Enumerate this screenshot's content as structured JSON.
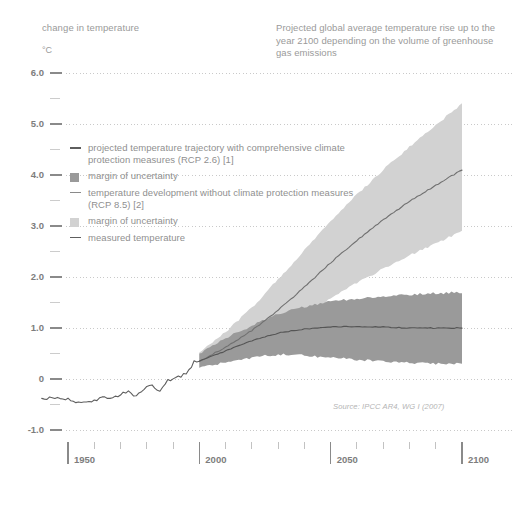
{
  "header": {
    "left_label": "change in temperature",
    "unit": "°C",
    "title": "Projected global average temperature rise up to the year 2100 depending on the volume of greenhouse gas emissions"
  },
  "source_note": "Source: IPCC AR4, WG I (2007)",
  "colors": {
    "background": "#ffffff",
    "text": "#8f8f8f",
    "axis": "#8a8a8a",
    "gridline": "#c9c9c9",
    "rcp26_band": "#9a9a9a",
    "rcp26_line": "#555555",
    "rcp85_band": "#d2d2d2",
    "rcp85_line": "#707070",
    "measured_line": "#5e5e5e"
  },
  "legend": {
    "items": [
      {
        "mark": "line",
        "color": "#5e5e5e",
        "label": "projected temperature trajectory with comprehensive climate protection measures (RCP 2.6) [1]"
      },
      {
        "mark": "swatch",
        "color": "#9a9a9a",
        "label": "margin of uncertainty"
      },
      {
        "mark": "line",
        "color": "#8a8a8a",
        "label": "temperature development without climate protection measures (RCP 8.5) [2]"
      },
      {
        "mark": "swatch",
        "color": "#d2d2d2",
        "label": "margin of uncertainty"
      },
      {
        "mark": "line",
        "color": "#5e5e5e",
        "label": "measured temperature"
      }
    ]
  },
  "chart_data": {
    "type": "line",
    "title": "Projected global average temperature rise up to the year 2100 depending on the volume of greenhouse gas emissions",
    "xlabel": "",
    "ylabel": "change in temperature",
    "yunit": "°C",
    "xlim": [
      1940,
      2100
    ],
    "ylim": [
      -1.0,
      6.0
    ],
    "xticks_major": [
      1950,
      2000,
      2050,
      2100
    ],
    "xticks_minor": [
      1960,
      1970,
      1980,
      1990,
      2010,
      2020,
      2030,
      2040,
      2060,
      2070,
      2080,
      2090
    ],
    "yticks_major": [
      -1.0,
      0,
      1.0,
      2.0,
      3.0,
      4.0,
      5.0,
      6.0
    ],
    "yticks_major_labels": [
      "-1.0",
      "0",
      "1.0",
      "2.0",
      "3.0",
      "4.0",
      "5.0",
      "6.0"
    ],
    "yticks_minor": [
      -0.5,
      0.5,
      1.5,
      2.5,
      3.5,
      4.5,
      5.5
    ],
    "grid": "horizontal-dotted",
    "legend_position": "inside-upper-left",
    "projection_start_year": 2000,
    "series": [
      {
        "name": "measured temperature",
        "type": "line",
        "x": [
          1940,
          1945,
          1950,
          1955,
          1960,
          1963,
          1965,
          1968,
          1970,
          1973,
          1976,
          1979,
          1982,
          1985,
          1988,
          1991,
          1994,
          1997,
          1998,
          2000
        ],
        "values": [
          -0.38,
          -0.36,
          -0.4,
          -0.48,
          -0.44,
          -0.36,
          -0.4,
          -0.34,
          -0.3,
          -0.24,
          -0.34,
          -0.18,
          -0.14,
          -0.22,
          -0.02,
          0.02,
          0.08,
          0.22,
          0.38,
          0.32
        ]
      },
      {
        "name": "RCP 2.6 mean",
        "type": "line",
        "x": [
          2000,
          2010,
          2020,
          2030,
          2040,
          2050,
          2060,
          2070,
          2080,
          2090,
          2100
        ],
        "values": [
          0.35,
          0.55,
          0.75,
          0.9,
          0.98,
          1.02,
          1.03,
          1.02,
          1.0,
          1.0,
          1.0
        ]
      },
      {
        "name": "RCP 2.6 margin of uncertainty",
        "type": "band",
        "x": [
          2000,
          2010,
          2020,
          2030,
          2040,
          2050,
          2060,
          2070,
          2080,
          2090,
          2100
        ],
        "lower": [
          0.22,
          0.32,
          0.42,
          0.48,
          0.46,
          0.42,
          0.38,
          0.34,
          0.32,
          0.3,
          0.3
        ],
        "upper": [
          0.5,
          0.8,
          1.05,
          1.28,
          1.42,
          1.52,
          1.58,
          1.62,
          1.65,
          1.68,
          1.7
        ]
      },
      {
        "name": "RCP 8.5 mean",
        "type": "line",
        "x": [
          2000,
          2010,
          2020,
          2030,
          2040,
          2050,
          2060,
          2070,
          2080,
          2090,
          2100
        ],
        "values": [
          0.35,
          0.62,
          0.95,
          1.35,
          1.8,
          2.28,
          2.72,
          3.12,
          3.48,
          3.8,
          4.1
        ]
      },
      {
        "name": "RCP 8.5 margin of uncertainty",
        "type": "band",
        "x": [
          2000,
          2010,
          2020,
          2030,
          2040,
          2050,
          2060,
          2070,
          2080,
          2090,
          2100
        ],
        "lower": [
          0.22,
          0.42,
          0.66,
          0.95,
          1.26,
          1.58,
          1.88,
          2.16,
          2.42,
          2.66,
          2.9
        ],
        "upper": [
          0.52,
          0.92,
          1.4,
          1.95,
          2.52,
          3.1,
          3.62,
          4.1,
          4.55,
          4.98,
          5.4
        ]
      }
    ]
  }
}
